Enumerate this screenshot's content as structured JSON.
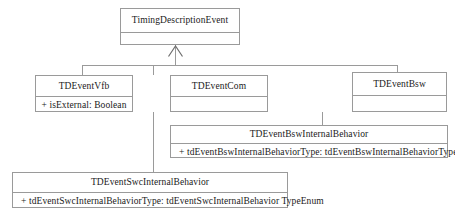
{
  "diagram": {
    "type": "uml-class-diagram",
    "relationship_label": "generalization",
    "colors": {
      "border": "#9a9a9a",
      "text": "#1a1a1a",
      "background": "#ffffff"
    }
  },
  "classes": {
    "root": {
      "name": "TimingDescriptionEvent",
      "attributes": []
    },
    "vfb": {
      "name": "TDEventVfb",
      "attributes": [
        "+ isExternal: Boolean"
      ]
    },
    "com": {
      "name": "TDEventCom",
      "attributes": []
    },
    "bsw": {
      "name": "TDEventBsw",
      "attributes": []
    },
    "bsw_internal_behavior": {
      "name": "TDEventBswInternalBehavior",
      "attributes": [
        "+ tdEventBswInternalBehaviorType: tdEventBswInternalBehaviorTypeEnum"
      ]
    },
    "swc_internal_behavior": {
      "name": "TDEventSwcInternalBehavior",
      "attributes": [
        "+ tdEventSwcInternalBehaviorType: tdEventSwcInternalBehavior TypeEnum"
      ]
    }
  }
}
